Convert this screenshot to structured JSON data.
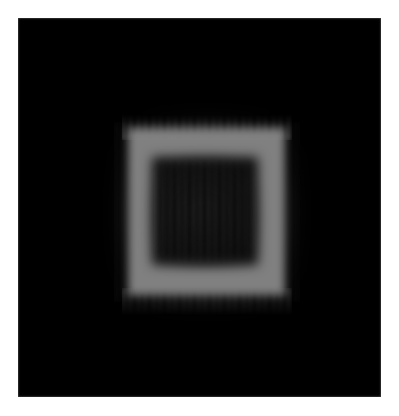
{
  "figure": {
    "width": 399,
    "height": 416,
    "page_background_color": "#ffffff",
    "margin_px": 18
  },
  "image": {
    "title": "Reconstructed square phantom",
    "modality": "grayscale reconstruction",
    "canvas": {
      "left": 18,
      "top": 18,
      "width": 363,
      "height": 379,
      "background_color": "#000000",
      "background_intensity": 0
    },
    "colormap": "gray",
    "intensity_range": [
      0,
      255
    ]
  },
  "objects": {
    "outer_square": {
      "label": "bright square frame",
      "color": "#808080",
      "intensity": 128,
      "left": 128,
      "top": 128,
      "width": 157,
      "height": 167,
      "edge_blur_px": 4.5
    },
    "inner_square": {
      "label": "dark inner square",
      "color": "#0d0d0d",
      "intensity": 13,
      "left": 152,
      "top": 157,
      "width": 106,
      "height": 108,
      "edge_blur_px": 6
    }
  },
  "artifacts": {
    "label": "vertical streak / ringing artifacts",
    "orientation": "vertical",
    "period_px": 7.5,
    "stripe_color": "#848484",
    "regions": [
      "top-edge",
      "bottom-edge",
      "inner-core",
      "left-right-haze"
    ],
    "halo_color": "#3c3c3c"
  }
}
